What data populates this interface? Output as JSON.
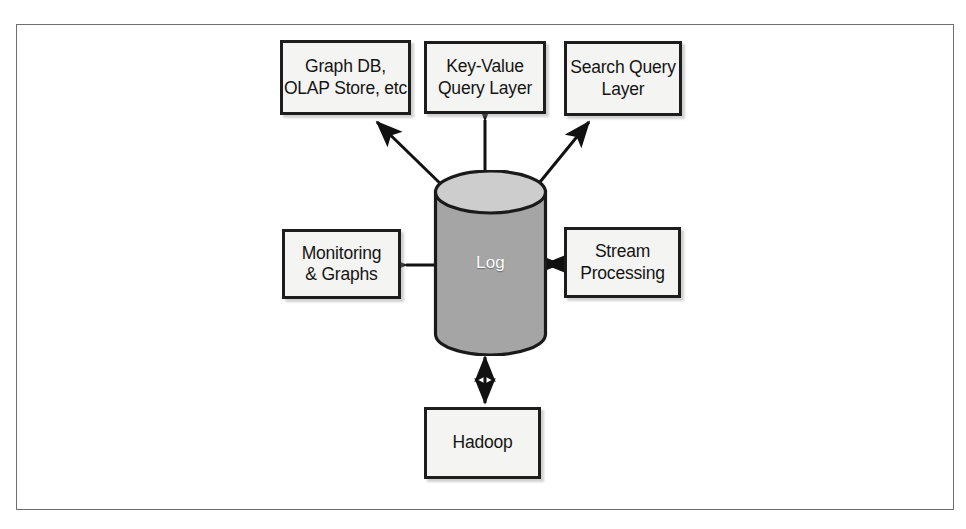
{
  "figure": {
    "type": "architecture-diagram",
    "center_node": {
      "shape": "cylinder",
      "label": "Log"
    },
    "boxes": [
      {
        "id": "graph-db",
        "lines": [
          "Graph DB,",
          "OLAP Store, etc"
        ]
      },
      {
        "id": "key-value",
        "lines": [
          "Key-Value",
          "Query Layer"
        ]
      },
      {
        "id": "search-query",
        "lines": [
          "Search Query",
          "Layer"
        ]
      },
      {
        "id": "monitoring",
        "lines": [
          "Monitoring",
          "& Graphs"
        ]
      },
      {
        "id": "stream",
        "lines": [
          "Stream",
          "Processing"
        ]
      },
      {
        "id": "hadoop",
        "lines": [
          "Hadoop"
        ]
      }
    ],
    "connections": [
      {
        "from": "Log",
        "to": "Graph DB, OLAP Store, etc",
        "direction": "one-way",
        "style": "diagonal"
      },
      {
        "from": "Log",
        "to": "Key-Value Query Layer",
        "direction": "two-way",
        "style": "vertical"
      },
      {
        "from": "Log",
        "to": "Search Query Layer",
        "direction": "one-way",
        "style": "diagonal"
      },
      {
        "from": "Log",
        "to": "Monitoring & Graphs",
        "direction": "one-way",
        "style": "horizontal"
      },
      {
        "from": "Log",
        "to": "Stream Processing",
        "direction": "two-way",
        "style": "horizontal"
      },
      {
        "from": "Log",
        "to": "Hadoop",
        "direction": "two-way",
        "style": "vertical"
      }
    ],
    "colors": {
      "box_fill": "#f4f4f2",
      "box_stroke": "#1d1d1d",
      "cylinder_top": "#cdcdcd",
      "cylinder_body": "#a5a5a5",
      "cylinder_stroke": "#1a1a1a",
      "arrow": "#111111",
      "frame_stroke": "#6d6f72",
      "page_background": "#ffffff",
      "cylinder_label": "#fdfdfd"
    }
  }
}
